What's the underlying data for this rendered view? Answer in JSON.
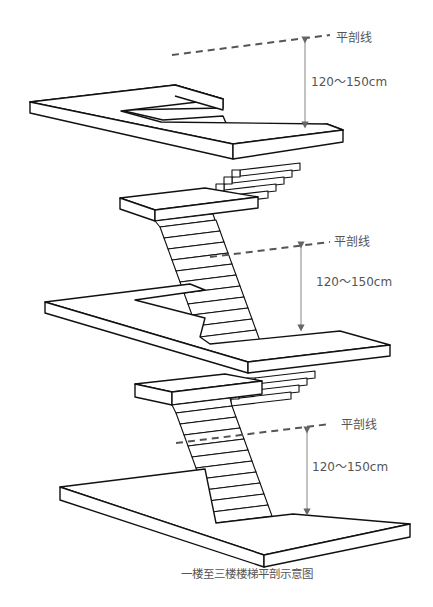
{
  "diagram": {
    "title": "一楼至三楼楼梯平剖示意图",
    "section_lines": [
      {
        "label": "平剖线",
        "dimension": "120～150cm"
      },
      {
        "label": "平剖线",
        "dimension": "120～150cm"
      },
      {
        "label": "平剖线",
        "dimension": "120～150cm"
      }
    ],
    "levels": [
      "一楼",
      "二楼",
      "三楼"
    ],
    "colors": {
      "line": "#111111",
      "section_line": "#555555",
      "dimension": "#777777",
      "text": "#555555"
    }
  }
}
